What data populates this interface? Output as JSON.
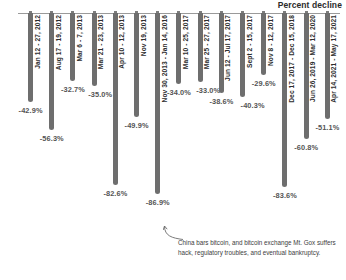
{
  "chart_data": {
    "type": "bar",
    "title": "Percent decline",
    "xlabel": "",
    "ylabel": "Percent decline",
    "ylim": [
      -100,
      0
    ],
    "grid": false,
    "legend": null,
    "orientation": "vertical-hanging",
    "categories": [
      "Jan 12 - 27, 2012",
      "Aug 17 - 19, 2012",
      "Mar 6 - 7, 2013",
      "Mar 21 - 23, 2013",
      "Apr 10 - 12, 2013",
      "Nov 19, 2013",
      "Nov 30, 2013 - Jan 14, 2016",
      "Mar 10 - 25, 2017",
      "Mar 25 - 27, 2017",
      "Jun 12 - Jul 17, 2017",
      "Sept 2 - 15, 2017",
      "Nov 8 - 12, 2017",
      "Dec 17, 2017 - Dec 15, 2018",
      "Jun 26, 2019 - Mar 12, 2020",
      "Apr 14, 2021 - May 17, 2021"
    ],
    "values": [
      -42.9,
      -56.3,
      -32.7,
      -35.0,
      -82.6,
      -49.9,
      -86.9,
      -34.0,
      -33.0,
      -38.6,
      -40.3,
      -29.6,
      -83.6,
      -60.8,
      -51.1
    ],
    "value_labels": [
      "-42.9%",
      "-56.3%",
      "-32.7%",
      "-35.0%",
      "-82.6%",
      "-49.9%",
      "-86.9%",
      "-34.0%",
      "-33.0%",
      "-38.6%",
      "-40.3%",
      "-29.6%",
      "-83.6%",
      "-60.8%",
      "-51.1%"
    ],
    "annotations": [
      {
        "text": "China bars bitcoin, and bitcoin exchange Mt. Gox suffers hack, regulatory troubles, and eventual bankruptcy.",
        "points_to": "Nov 30, 2013 - Jan 14, 2016"
      }
    ],
    "colors": {
      "bar": "#6e6e6e",
      "axis": "#9a9a9a",
      "marker": "#7d7d7d",
      "value_label": "#555555",
      "date_label": "#2d2d2d",
      "title": "#2b2b2b",
      "background": "#ffffff"
    }
  }
}
